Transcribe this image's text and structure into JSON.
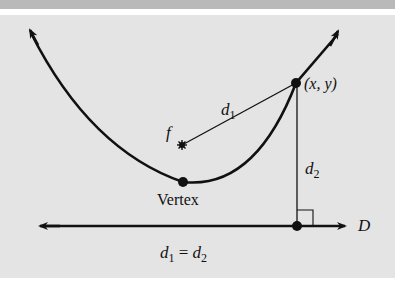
{
  "diagram": {
    "labels": {
      "focus": "f",
      "point": "(x, y)",
      "distance_1": "d",
      "distance_1_sub": "1",
      "distance_2": "d",
      "distance_2_sub": "2",
      "vertex": "Vertex",
      "directrix": "D",
      "equation_lhs": "d",
      "equation_lhs_sub": "1",
      "equation_op": " = ",
      "equation_rhs": "d",
      "equation_rhs_sub": "2"
    },
    "colors": {
      "top_strip": "#b9b9b9",
      "panel": "#e4e4e4",
      "ink": "#111111"
    },
    "points": {
      "focus": [
        182,
        145
      ],
      "vertex": [
        183,
        182
      ],
      "point_xy": [
        296,
        83
      ],
      "foot": [
        297,
        226
      ]
    }
  }
}
